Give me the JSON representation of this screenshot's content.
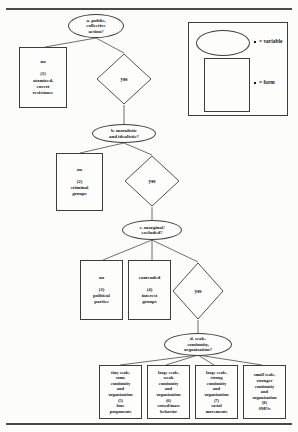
{
  "figure": {
    "kind": "decision-flowchart",
    "title_rule_top": "",
    "title_rule_bottom": ""
  },
  "legend": {
    "variable_label": "= variable",
    "form_label": "= form",
    "ellipse_shape": "ellipse-shape",
    "rect_shape": "rectangle-shape"
  },
  "decisions": [
    {
      "id": "a",
      "text_lines": [
        "a. public,",
        "collective",
        "action?"
      ]
    },
    {
      "id": "b",
      "text_lines": [
        "b. moralistic",
        "and idealistic?"
      ]
    },
    {
      "id": "c",
      "text_lines": [
        "c. marginal/",
        "excluded?"
      ]
    },
    {
      "id": "d",
      "text_lines": [
        "d. scale,",
        "continuity,",
        "organization?"
      ]
    }
  ],
  "branches": [
    {
      "id": "yes-a",
      "label": "yes"
    },
    {
      "id": "yes-b",
      "label": "yes"
    },
    {
      "id": "yes-c",
      "label": "yes"
    }
  ],
  "outcomes": [
    {
      "number": "(1)",
      "answer": "no",
      "name_lines": [
        "atomized,",
        "covert",
        "resistance"
      ]
    },
    {
      "number": "(2)",
      "answer": "no",
      "name_lines": [
        "criminal",
        "groups"
      ]
    },
    {
      "number": "(3)",
      "answer": "no",
      "name_lines": [
        "political",
        "parties"
      ]
    },
    {
      "number": "(4)",
      "answer": "contended",
      "name_lines": [
        "interest",
        "groups"
      ]
    },
    {
      "number": "(5)",
      "answer": "",
      "desc_lines": [
        "tiny scale,",
        "some",
        "continuity",
        "and",
        "organization"
      ],
      "name_lines": [
        "lone",
        "proponents"
      ]
    },
    {
      "number": "(6)",
      "answer": "",
      "desc_lines": [
        "large scale,",
        "weak",
        "continuity",
        "and",
        "organization"
      ],
      "name_lines": [
        "crowd/mass",
        "behavior"
      ]
    },
    {
      "number": "(7)",
      "answer": "",
      "desc_lines": [
        "large scale,",
        "strong",
        "continuity",
        "and",
        "organization"
      ],
      "name_lines": [
        "social",
        "movements"
      ]
    },
    {
      "number": "(8)",
      "answer": "",
      "desc_lines": [
        "small scale,",
        "stronger",
        "continuity",
        "and",
        "organization"
      ],
      "name_lines": [
        "SMOs"
      ]
    }
  ],
  "colors": {
    "ink": "#141414",
    "stroke": "#3d3d3b",
    "paper": "#fcfcfa"
  }
}
